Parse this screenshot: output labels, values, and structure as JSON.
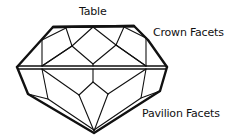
{
  "figure": {
    "type": "gemstone-cut-diagram",
    "colors": {
      "line": "#111111",
      "background": "#ffffff"
    }
  },
  "labels": {
    "table": "Table",
    "crown": "Crown Facets",
    "pavilion": "Pavilion Facets"
  }
}
